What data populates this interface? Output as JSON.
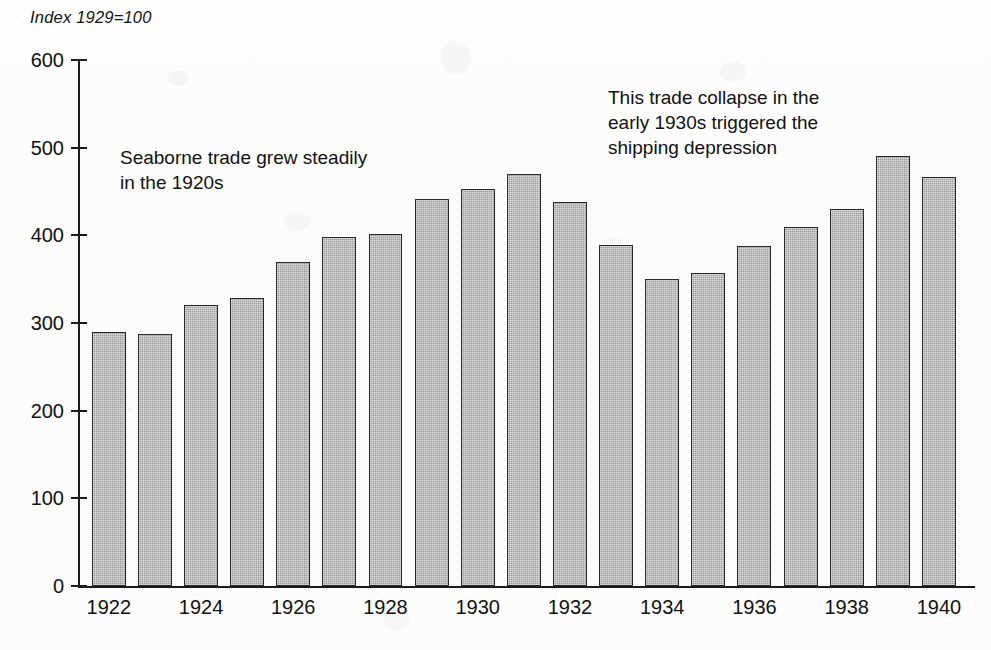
{
  "chart_data": {
    "type": "bar",
    "title": "Index 1929=100",
    "xlabel": "",
    "ylabel": "",
    "ylim": [
      0,
      600
    ],
    "ytick_step": 100,
    "yticks": [
      600,
      500,
      400,
      300,
      200,
      100,
      0
    ],
    "grid": false,
    "legend": null,
    "categories": [
      "1922",
      "1923",
      "1924",
      "1925",
      "1926",
      "1927",
      "1928",
      "1929",
      "1930",
      "1931",
      "1932",
      "1933",
      "1934",
      "1935",
      "1936",
      "1937",
      "1938",
      "1939",
      "1940"
    ],
    "xtick_labels": [
      "1922",
      "",
      "1924",
      "",
      "1926",
      "",
      "1928",
      "",
      "1930",
      "",
      "1932",
      "",
      "1934",
      "",
      "1936",
      "",
      "1938",
      "",
      "1940"
    ],
    "values": [
      290,
      287,
      321,
      328,
      370,
      398,
      401,
      442,
      453,
      470,
      438,
      389,
      350,
      357,
      388,
      409,
      430,
      490,
      467
    ],
    "series": [
      {
        "name": "Seaborne trade index",
        "values": [
          290,
          287,
          321,
          328,
          370,
          398,
          401,
          442,
          453,
          470,
          438,
          389,
          350,
          357,
          388,
          409,
          430,
          490,
          467
        ]
      }
    ],
    "annotations": [
      {
        "id": "annotation-1920s",
        "text": "Seaborne trade grew steadily\nin the 1920s"
      },
      {
        "id": "annotation-1930s",
        "text": "This trade collapse in the\nearly 1930s triggered the\nshipping depression"
      }
    ],
    "colors": {
      "bar_fill": "#9c9c9c",
      "bar_border": "#2a2a2a",
      "axis": "#1b1b1b",
      "text": "#111111",
      "background": "#ffffff"
    }
  }
}
